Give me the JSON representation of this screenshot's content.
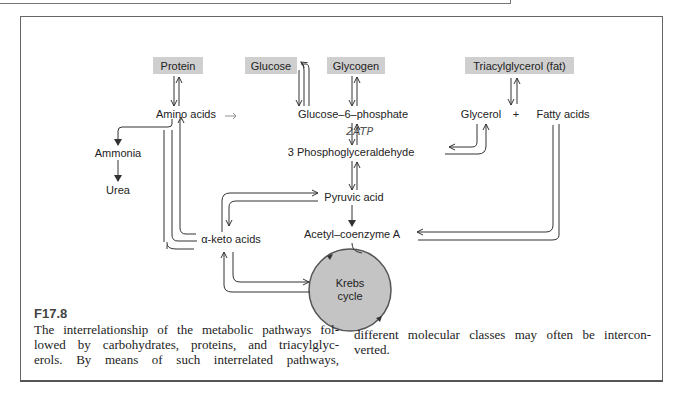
{
  "figure": {
    "id": "F17.8",
    "caption_lines_left": [
      "The interrelationship of the metabolic pathways fol-",
      "lowed by carbohydrates, proteins, and triacylglyc-",
      "erols. By means of such interrelated pathways,"
    ],
    "caption_lines_right": [
      "different molecular classes may often be intercon-",
      "verted."
    ]
  },
  "diagram": {
    "sources": {
      "protein": "Protein",
      "glucose": "Glucose",
      "glycogen": "Glycogen",
      "triacylglycerol": "Triacylglycerol (fat)"
    },
    "nodes": {
      "amino_acids": "Amino acids",
      "ammonia": "Ammonia",
      "urea": "Urea",
      "glucose_6_phosphate": "Glucose–6–phosphate",
      "phosphoglyceraldehyde": "3 Phosphoglyceraldehyde",
      "glycerol": "Glycerol",
      "plus": "+",
      "fatty_acids": "Fatty acids",
      "pyruvic_acid": "Pyruvic acid",
      "keto_acids": "α-keto acids",
      "acetyl_coa": "Acetyl–coenzyme A",
      "krebs_line1": "Krebs",
      "krebs_line2": "cycle"
    },
    "handwritten_note": "2ATP",
    "colors": {
      "source_box": "#cfcfcf",
      "krebs_circle": "#c4c4c4",
      "line": "#333333"
    }
  }
}
